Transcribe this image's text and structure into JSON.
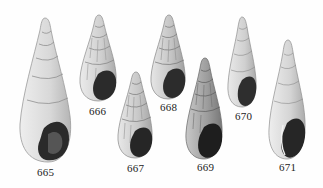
{
  "plate": {
    "description": "Plate of gastropod shell illustrations",
    "background": "#fefefe",
    "shells": [
      {
        "number": "665",
        "tone": "#d9d9d9",
        "ridges": false
      },
      {
        "number": "666",
        "tone": "#cfcfcf",
        "ridges": true
      },
      {
        "number": "667",
        "tone": "#c9c9c9",
        "ridges": true
      },
      {
        "number": "668",
        "tone": "#c6c6c6",
        "ridges": true
      },
      {
        "number": "669",
        "tone": "#9e9e9e",
        "ridges": true
      },
      {
        "number": "670",
        "tone": "#d2d2d2",
        "ridges": false
      },
      {
        "number": "671",
        "tone": "#d6d6d6",
        "ridges": false
      }
    ]
  }
}
